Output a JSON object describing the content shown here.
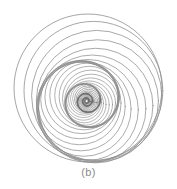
{
  "figure": {
    "caption": "(b)",
    "background_color": "#ffffff",
    "stroke_color": "#8c8c8c",
    "stroke_color_dense": "#6e6e6e",
    "caption_color": "#8a8a8a",
    "width": 177,
    "height": 189
  },
  "chart_data": {
    "type": "line",
    "title": "(b)",
    "subtitle": "Spiral family of internally tangent circles",
    "xlabel": "",
    "ylabel": "",
    "grid": false,
    "legend": false,
    "axes_visible": false,
    "xlim": [
      0,
      177
    ],
    "ylim": [
      0,
      175
    ],
    "geometry": {
      "description": "Each circle is generated from the previous one by scaling its radius by a fixed ratio and rotating its center about the figure centre by a fixed angle, giving a logarithmic spiral of circles that accumulate into a thick band at the rim and a dense rosette at the core.",
      "center_x": 88,
      "center_y": 88,
      "outer_radius": 74,
      "circle_count": 60,
      "radius_ratio": 0.938,
      "rotation_step_deg": 27.5,
      "offset_ratio": 0.33,
      "stroke_width_outer": 0.85,
      "stroke_width_inner": 0.55
    },
    "circles": [
      {
        "i": 0,
        "cx": 88.0,
        "cy": 88.0,
        "r": 74.0,
        "rotation_deg": 0.0
      },
      {
        "i": 1,
        "cx": 89.5,
        "cy": 89.4,
        "r": 69.4,
        "rotation_deg": 27.5
      },
      {
        "i": 2,
        "cx": 92.3,
        "cy": 90.1,
        "r": 65.1,
        "rotation_deg": 55.0
      },
      {
        "i": 3,
        "cx": 94.8,
        "cy": 88.6,
        "r": 61.1,
        "rotation_deg": 82.5
      },
      {
        "i": 4,
        "cx": 95.6,
        "cy": 85.4,
        "r": 57.3,
        "rotation_deg": 110.0
      },
      {
        "i": 5,
        "cx": 94.1,
        "cy": 82.1,
        "r": 53.7,
        "rotation_deg": 137.5
      },
      {
        "i": 6,
        "cx": 90.9,
        "cy": 80.4,
        "r": 50.4,
        "rotation_deg": 165.0
      },
      {
        "i": 7,
        "cx": 87.4,
        "cy": 81.1,
        "r": 47.3,
        "rotation_deg": 192.5
      },
      {
        "i": 8,
        "cx": 85.1,
        "cy": 83.8,
        "r": 44.4,
        "rotation_deg": 220.0
      },
      {
        "i": 9,
        "cx": 84.9,
        "cy": 87.3,
        "r": 41.6,
        "rotation_deg": 247.5
      },
      {
        "i": 10,
        "cx": 86.7,
        "cy": 90.1,
        "r": 39.0,
        "rotation_deg": 275.0
      },
      {
        "i": 11,
        "cx": 89.4,
        "cy": 91.1,
        "r": 36.6,
        "rotation_deg": 302.5
      },
      {
        "i": 12,
        "cx": 91.7,
        "cy": 90.0,
        "r": 34.3,
        "rotation_deg": 330.0
      },
      {
        "i": 13,
        "cx": 92.5,
        "cy": 87.7,
        "r": 32.2,
        "rotation_deg": 357.5
      },
      {
        "i": 14,
        "cx": 91.5,
        "cy": 85.5,
        "r": 30.2,
        "rotation_deg": 25.0
      },
      {
        "i": 15,
        "cx": 89.4,
        "cy": 84.5,
        "r": 28.3,
        "rotation_deg": 52.5
      },
      {
        "i": 16,
        "cx": 87.2,
        "cy": 85.1,
        "r": 26.6,
        "rotation_deg": 80.0
      },
      {
        "i": 17,
        "cx": 86.0,
        "cy": 86.9,
        "r": 24.9,
        "rotation_deg": 107.5
      },
      {
        "i": 18,
        "cx": 86.3,
        "cy": 89.1,
        "r": 23.4,
        "rotation_deg": 135.0
      },
      {
        "i": 19,
        "cx": 87.7,
        "cy": 90.5,
        "r": 21.9,
        "rotation_deg": 162.5
      },
      {
        "i": 20,
        "cx": 89.5,
        "cy": 90.5,
        "r": 20.6,
        "rotation_deg": 190.0
      },
      {
        "i": 21,
        "cx": 90.6,
        "cy": 89.2,
        "r": 19.3,
        "rotation_deg": 217.5
      },
      {
        "i": 22,
        "cx": 90.4,
        "cy": 87.5,
        "r": 18.1,
        "rotation_deg": 245.0
      },
      {
        "i": 23,
        "cx": 89.2,
        "cy": 86.5,
        "r": 17.0,
        "rotation_deg": 272.5
      },
      {
        "i": 24,
        "cx": 87.7,
        "cy": 86.7,
        "r": 15.9,
        "rotation_deg": 300.0
      },
      {
        "i": 25,
        "cx": 86.9,
        "cy": 87.9,
        "r": 14.9,
        "rotation_deg": 327.5
      }
    ]
  }
}
